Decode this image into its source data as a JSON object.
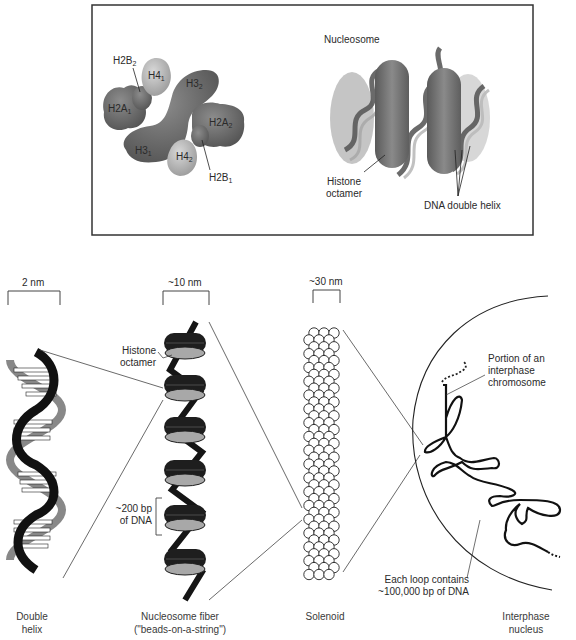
{
  "top_panel": {
    "title": "Nucleosome",
    "histones": [
      {
        "base": "H2B",
        "sub": "2"
      },
      {
        "base": "H4",
        "sub": "1"
      },
      {
        "base": "H3",
        "sub": "2"
      },
      {
        "base": "H2A",
        "sub": "1"
      },
      {
        "base": "H2A",
        "sub": "2"
      },
      {
        "base": "H3",
        "sub": "1"
      },
      {
        "base": "H4",
        "sub": "2"
      },
      {
        "base": "H2B",
        "sub": "1"
      }
    ],
    "histone_octamer_label_line1": "Histone",
    "histone_octamer_label_line2": "octamer",
    "dna_double_helix_label": "DNA double helix"
  },
  "scales": {
    "double_helix": "2 nm",
    "nucleosome_fiber": "~10 nm",
    "solenoid": "~30 nm"
  },
  "fiber_labels": {
    "histone_octamer_line1": "Histone",
    "histone_octamer_line2": "octamer",
    "bp_line1": "~200 bp",
    "bp_line2": "of DNA"
  },
  "nucleus_labels": {
    "portion_line1": "Portion of an",
    "portion_line2": "interphase",
    "portion_line3": "chromosome",
    "loop_line1": "Each loop contains",
    "loop_line2": "~100,000 bp of DNA"
  },
  "captions": {
    "double_helix_line1": "Double",
    "double_helix_line2": "helix",
    "fiber_line1": "Nucleosome fiber",
    "fiber_line2": "(\"beads-on-a-string\")",
    "solenoid": "Solenoid",
    "nucleus_line1": "Interphase",
    "nucleus_line2": "nucleus"
  },
  "colors": {
    "dark_histone": "#6e6e6e",
    "light_histone": "#b4b4b4",
    "bead_dark": "#1e1e1e",
    "bead_face": "#a8a8a8",
    "line": "#3a3a3a"
  }
}
